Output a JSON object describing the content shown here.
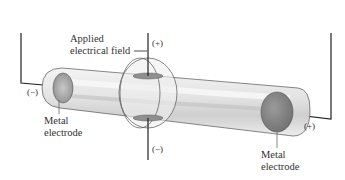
{
  "diagram": {
    "type": "discharge tube with deflection plates",
    "labels": {
      "applied_field_line1": "Applied",
      "applied_field_line2": "electrical field",
      "left_electrode_line1": "Metal",
      "left_electrode_line2": "electrode",
      "right_electrode_line1": "Metal",
      "right_electrode_line2": "electrode"
    },
    "polarity": {
      "left_electrode": "(−)",
      "right_electrode": "(+)",
      "top_plate": "(+)",
      "bottom_plate": "(−)"
    },
    "colors": {
      "tube_glass": "#e6e6e6",
      "electrode": "#8a8a8a",
      "wire": "#222222",
      "text": "#333333"
    }
  }
}
